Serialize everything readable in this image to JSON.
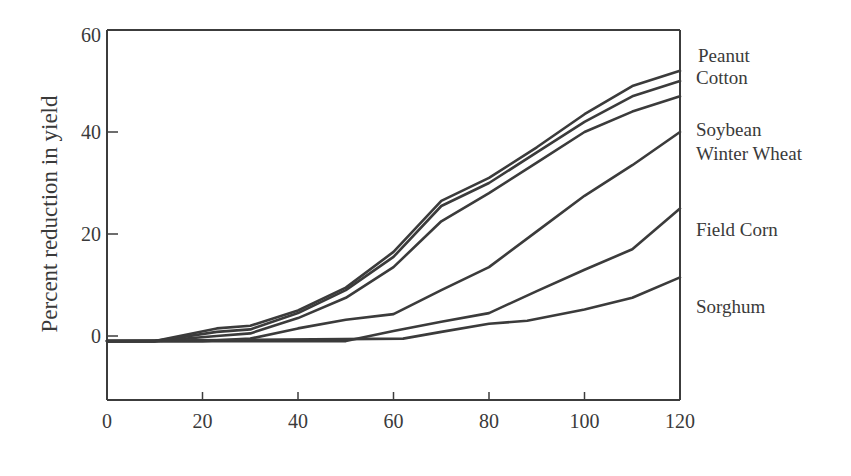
{
  "chart_data": {
    "type": "line",
    "title": "",
    "xlabel": "",
    "ylabel": "Percent reduction in yield",
    "xlim": [
      0,
      120
    ],
    "ylim": [
      -12.5,
      60
    ],
    "x_ticks": [
      0,
      20,
      40,
      60,
      80,
      100,
      120
    ],
    "y_ticks": [
      0,
      20,
      40,
      60
    ],
    "grid": false,
    "legend_position": "right (direct labels at line ends)",
    "series": [
      {
        "name": "Peanut",
        "points": [
          [
            0,
            -1
          ],
          [
            10,
            -1
          ],
          [
            23,
            1.5
          ],
          [
            30,
            2
          ],
          [
            40,
            5
          ],
          [
            50,
            9.5
          ],
          [
            60,
            16.5
          ],
          [
            70,
            26.5
          ],
          [
            80,
            31
          ],
          [
            90,
            37
          ],
          [
            100,
            43.5
          ],
          [
            110,
            49
          ],
          [
            120,
            52
          ]
        ]
      },
      {
        "name": "Cotton",
        "points": [
          [
            0,
            -1
          ],
          [
            10,
            -1
          ],
          [
            23,
            0.8
          ],
          [
            30,
            1.3
          ],
          [
            40,
            4.5
          ],
          [
            50,
            9
          ],
          [
            60,
            15.5
          ],
          [
            70,
            25.5
          ],
          [
            80,
            30
          ],
          [
            90,
            36
          ],
          [
            100,
            42
          ],
          [
            110,
            47
          ],
          [
            120,
            50
          ]
        ]
      },
      {
        "name": "Soybean",
        "points": [
          [
            0,
            -1
          ],
          [
            10,
            -1
          ],
          [
            23,
            0
          ],
          [
            30,
            0.5
          ],
          [
            40,
            3.5
          ],
          [
            50,
            7.5
          ],
          [
            60,
            13.5
          ],
          [
            70,
            22.5
          ],
          [
            80,
            28
          ],
          [
            90,
            34
          ],
          [
            100,
            40
          ],
          [
            110,
            44
          ],
          [
            120,
            47
          ]
        ]
      },
      {
        "name": "Winter Wheat",
        "points": [
          [
            0,
            -1
          ],
          [
            20,
            -1
          ],
          [
            30,
            -0.5
          ],
          [
            40,
            1.5
          ],
          [
            50,
            3.2
          ],
          [
            60,
            4.3
          ],
          [
            70,
            9
          ],
          [
            80,
            13.5
          ],
          [
            90,
            20.5
          ],
          [
            100,
            27.5
          ],
          [
            110,
            33.5
          ],
          [
            120,
            40
          ]
        ]
      },
      {
        "name": "Field Corn",
        "points": [
          [
            0,
            -1
          ],
          [
            50,
            -1
          ],
          [
            60,
            1
          ],
          [
            70,
            2.8
          ],
          [
            80,
            4.5
          ],
          [
            90,
            8.8
          ],
          [
            100,
            13
          ],
          [
            110,
            17
          ],
          [
            120,
            25
          ]
        ]
      },
      {
        "name": "Sorghum",
        "points": [
          [
            0,
            -1
          ],
          [
            62,
            -0.5
          ],
          [
            70,
            0.8
          ],
          [
            80,
            2.4
          ],
          [
            88,
            3
          ],
          [
            100,
            5.2
          ],
          [
            110,
            7.5
          ],
          [
            120,
            11.5
          ]
        ]
      }
    ],
    "annotations": [
      "Peanut",
      "Cotton",
      "Soybean",
      "Winter Wheat",
      "Field Corn",
      "Sorghum"
    ]
  },
  "axes": {
    "ylabel": "Percent reduction in yield",
    "x_tick_labels": [
      "0",
      "20",
      "40",
      "60",
      "80",
      "100",
      "120"
    ],
    "y_tick_labels": [
      "60",
      "40",
      "20",
      "0"
    ]
  },
  "labels": {
    "peanut": "Peanut",
    "cotton": "Cotton",
    "soybean": "Soybean",
    "winter_wheat": "Winter Wheat",
    "field_corn": "Field Corn",
    "sorghum": "Sorghum"
  },
  "colors": {
    "line": "#3b3b3b",
    "axis": "#3c3c3c",
    "text": "#3a3a3a",
    "background": "#ffffff"
  }
}
